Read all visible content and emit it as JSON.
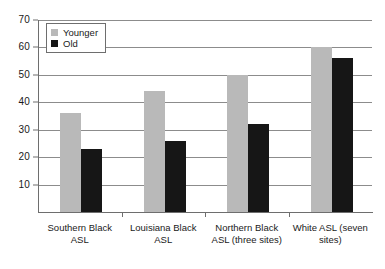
{
  "chart_data": {
    "type": "bar",
    "title": "",
    "subtitle": "",
    "xlabel": "",
    "ylabel": "",
    "ylim": [
      0,
      70
    ],
    "ytick_step": 10,
    "yticks": [
      70,
      60,
      50,
      40,
      30,
      20,
      10
    ],
    "grid": true,
    "legend_position": "top-left",
    "categories": [
      "Southern Black ASL",
      "Louisiana Black ASL",
      "Northern Black ASL (three sites)",
      "White ASL (seven sites)"
    ],
    "category_lines": [
      [
        "Southern Black",
        "ASL"
      ],
      [
        "Louisiana Black",
        "ASL"
      ],
      [
        "Northern Black",
        "ASL (three sites)"
      ],
      [
        "White ASL (seven",
        "sites)"
      ]
    ],
    "series": [
      {
        "name": "Younger",
        "color": "#b9b9b9",
        "values": [
          36,
          44,
          50,
          60
        ]
      },
      {
        "name": "Old",
        "color": "#161616",
        "values": [
          23,
          26,
          32,
          56
        ]
      }
    ]
  },
  "legend": {
    "items": [
      {
        "label": "Younger",
        "swatch": "younger"
      },
      {
        "label": "Old",
        "swatch": "old"
      }
    ]
  }
}
